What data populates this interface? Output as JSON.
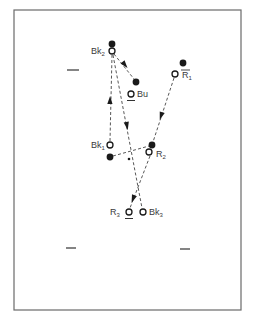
{
  "figure": {
    "frame": {
      "x": 14,
      "y": 10,
      "w": 227,
      "h": 300,
      "color": "#6a6a6a"
    },
    "ink_color": "#1a1a1a",
    "points": [
      {
        "id": "Bk2",
        "label": "Bk",
        "sub": "2",
        "open": {
          "x": 112,
          "y": 51
        },
        "filled": {
          "x": 112,
          "y": 44
        },
        "label_pos": {
          "x": 91,
          "y": 54
        },
        "label_side": "left"
      },
      {
        "id": "Bu",
        "label": "Bu",
        "sub": "",
        "open": {
          "x": 131,
          "y": 94
        },
        "filled": {
          "x": 136,
          "y": 82
        },
        "label_pos": {
          "x": 137,
          "y": 97
        },
        "label_side": "right",
        "underline": true
      },
      {
        "id": "R1",
        "label": "R",
        "sub": "1",
        "open": {
          "x": 175,
          "y": 74
        },
        "filled": {
          "x": 183,
          "y": 63
        },
        "label_pos": {
          "x": 182,
          "y": 78
        },
        "label_side": "right",
        "overline": true
      },
      {
        "id": "Bk1",
        "label": "Bk",
        "sub": "1",
        "open": {
          "x": 110,
          "y": 145
        },
        "filled": {
          "x": 110,
          "y": 157
        },
        "label_pos": {
          "x": 91,
          "y": 148
        },
        "label_side": "left"
      },
      {
        "id": "R2",
        "label": "R",
        "sub": "2",
        "open": {
          "x": 149,
          "y": 152
        },
        "filled": {
          "x": 152,
          "y": 145
        },
        "label_pos": {
          "x": 156,
          "y": 157
        },
        "label_side": "right"
      },
      {
        "id": "R3",
        "label": "R",
        "sub": "3",
        "open": {
          "x": 129,
          "y": 212
        },
        "filled": null,
        "label_pos": {
          "x": 110,
          "y": 215
        },
        "label_side": "left",
        "underline": true
      },
      {
        "id": "Bk3",
        "label": "Bk",
        "sub": "3",
        "open": {
          "x": 143,
          "y": 212
        },
        "filled": null,
        "label_pos": {
          "x": 149,
          "y": 215
        },
        "label_side": "right"
      }
    ],
    "center_dot": {
      "x": 129,
      "y": 159
    },
    "arrows": [
      {
        "from": "Bk1",
        "to": "Bk2",
        "x1": 110,
        "y1": 141,
        "x2": 112,
        "y2": 55,
        "head": {
          "x": 110,
          "y": 100,
          "dir": "up"
        }
      },
      {
        "from": "Bk2",
        "to": "Bu",
        "x1": 114,
        "y1": 54,
        "x2": 134,
        "y2": 79,
        "head": {
          "x": 125,
          "y": 65,
          "dir": "down-right"
        }
      },
      {
        "from": "Bk2",
        "to": "Bk3",
        "x1": 113,
        "y1": 55,
        "x2": 142,
        "y2": 208,
        "head": {
          "x": 127,
          "y": 126,
          "dir": "down"
        }
      },
      {
        "from": "R1",
        "to": "R2",
        "x1": 174,
        "y1": 78,
        "x2": 153,
        "y2": 142,
        "head": {
          "x": 161,
          "y": 116,
          "dir": "down-left"
        }
      },
      {
        "from": "R2",
        "to": "R3",
        "x1": 150,
        "y1": 156,
        "x2": 130,
        "y2": 208,
        "head": {
          "x": 133,
          "y": 199,
          "dir": "down-left"
        }
      },
      {
        "from": "Bk1-filled",
        "to": "R2-filled",
        "x1": 113,
        "y1": 156,
        "x2": 149,
        "y2": 146,
        "head": null
      }
    ],
    "dashes": [
      {
        "x1": 67,
        "y1": 70,
        "x2": 79,
        "y2": 70
      },
      {
        "x1": 66,
        "y1": 248,
        "x2": 76,
        "y2": 248
      },
      {
        "x1": 180,
        "y1": 249,
        "x2": 190,
        "y2": 249
      }
    ]
  }
}
